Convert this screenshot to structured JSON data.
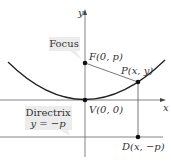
{
  "diagram": {
    "type": "parabola-focus-directrix",
    "axes": {
      "x_label": "x",
      "y_label": "y"
    },
    "points": {
      "focus": {
        "label": "F(0, p)"
      },
      "vertex": {
        "label": "V(0, 0)"
      },
      "point": {
        "label": "P(x, y)"
      },
      "directrix_point": {
        "label": "D(x, −p)"
      }
    },
    "callouts": {
      "focus": {
        "text": "Focus"
      },
      "directrix": {
        "line1": "Directrix",
        "line2": "y = −p"
      }
    },
    "colors": {
      "curve": "#222222",
      "axes": "#555555",
      "callout_bg": "#ececec",
      "text": "#333333"
    }
  }
}
